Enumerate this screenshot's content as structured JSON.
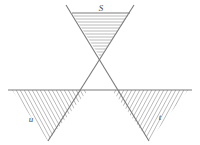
{
  "figure": {
    "background_color": "#ffffff",
    "line_color": "#7a7a7a",
    "hatch_color": "#a8a8a8",
    "label_color": "#4a4a4a",
    "labels": {
      "top_region": "S",
      "bottom_left_region": "u",
      "bottom_right_region": "t"
    },
    "label_positions": {
      "top_region": {
        "x": 101,
        "y": 11
      },
      "bottom_left_region": {
        "x": 31,
        "y": 122
      },
      "bottom_right_region": {
        "x": 160,
        "y": 120
      }
    },
    "geometry": {
      "crossing_point": {
        "x": 100,
        "y": 57
      },
      "horizontal_line": {
        "x1": 8,
        "y1": 90,
        "x2": 192,
        "y2": 90
      },
      "diagonal_down_right": {
        "x1": 66,
        "y1": 5,
        "x2": 149,
        "y2": 141
      },
      "diagonal_down_left": {
        "x1": 134,
        "y1": 5,
        "x2": 48,
        "y2": 141
      },
      "top_chord": {
        "x1": 72,
        "y1": 13,
        "x2": 130,
        "y2": 13
      }
    },
    "regions": [
      {
        "name": "S",
        "shape": "downward-pointing-triangle",
        "hatch_style": "horizontal",
        "hatch_line_count": 13,
        "apex": {
          "x": 100,
          "y": 57
        }
      },
      {
        "name": "u",
        "shape": "downward-pointing-triangle",
        "hatch_style": "diagonal-backslash",
        "hatch_line_count": 22,
        "apex": {
          "x": 48,
          "y": 141
        }
      },
      {
        "name": "t",
        "shape": "downward-pointing-triangle",
        "hatch_style": "diagonal-forwardslash",
        "hatch_line_count": 22,
        "apex": {
          "x": 149,
          "y": 141
        }
      }
    ]
  }
}
